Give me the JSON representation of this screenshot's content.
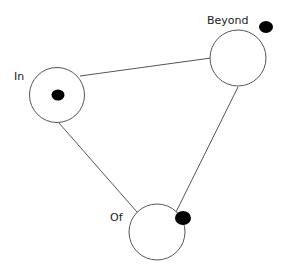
{
  "diagram": {
    "type": "network",
    "colors": {
      "node_stroke": "#555555",
      "edge": "#555555",
      "marker": "#000000",
      "text": "#222222"
    },
    "nodes": [
      {
        "id": "in",
        "label": "In",
        "has_marker": true
      },
      {
        "id": "beyond",
        "label": "Beyond",
        "has_marker": true
      },
      {
        "id": "of",
        "label": "Of",
        "has_marker": true
      }
    ],
    "edges": [
      {
        "from": "In",
        "to": "Beyond"
      },
      {
        "from": "In",
        "to": "Of"
      },
      {
        "from": "Beyond",
        "to": "Of"
      }
    ]
  }
}
